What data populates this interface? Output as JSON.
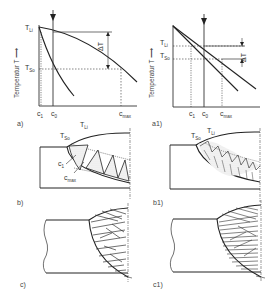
{
  "figure": {
    "panels": [
      {
        "id": "a",
        "label": "a)"
      },
      {
        "id": "a1",
        "label": "a1)"
      },
      {
        "id": "b",
        "label": "b)"
      },
      {
        "id": "b1",
        "label": "b1)"
      },
      {
        "id": "c",
        "label": "c)"
      },
      {
        "id": "c1",
        "label": "c1)"
      }
    ]
  },
  "chart_a": {
    "ylabel": "Temperatur  T",
    "arrow": "⟶",
    "T_Li": {
      "main": "T",
      "sub": "Li"
    },
    "T_So": {
      "main": "T",
      "sub": "So"
    },
    "delta": "ΔT",
    "x_ticks": [
      {
        "main": "c",
        "sub": "1"
      },
      {
        "main": "c",
        "sub": "0"
      },
      {
        "main": "c",
        "sub": "max"
      }
    ]
  },
  "chart_a1": {
    "ylabel": "Temperatur  T",
    "arrow": "⟶",
    "T_Li": {
      "main": "T",
      "sub": "Li"
    },
    "T_So": {
      "main": "T",
      "sub": "So"
    },
    "delta": "ΔT",
    "x_ticks": [
      {
        "main": "c",
        "sub": "1"
      },
      {
        "main": "c",
        "sub": "0"
      },
      {
        "main": "c",
        "sub": "max"
      }
    ]
  },
  "weld_b": {
    "T_So": {
      "main": "T",
      "sub": "So"
    },
    "T_Li": {
      "main": "T",
      "sub": "Li"
    },
    "c1": {
      "main": "c",
      "sub": "1"
    },
    "cmax": {
      "main": "c",
      "sub": "max"
    }
  },
  "weld_b1": {
    "T_So": {
      "main": "T",
      "sub": "So"
    },
    "T_Li": {
      "main": "T",
      "sub": "Li"
    }
  }
}
